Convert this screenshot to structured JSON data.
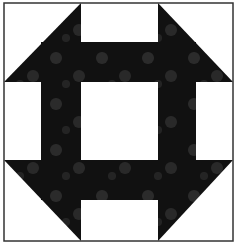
{
  "figure": {
    "width": 238,
    "height": 246
  },
  "colors": {
    "background": "#ffffff",
    "fabric_dark": "#111111",
    "fabric_speckle": "#4a4a4a",
    "outline": "#333333"
  },
  "block": {
    "x": 4,
    "y": 3,
    "w": 229,
    "h": 238,
    "grid_x": [
      4,
      81,
      158,
      233
    ],
    "grid_y": [
      3,
      82,
      160,
      241
    ]
  }
}
